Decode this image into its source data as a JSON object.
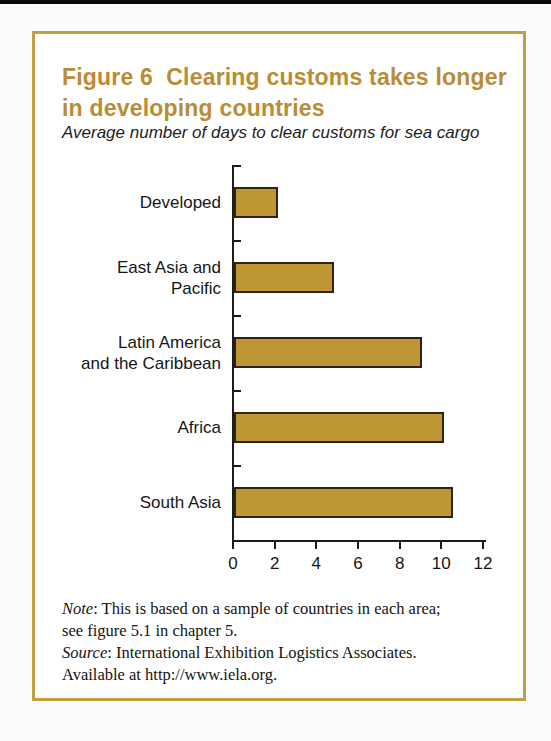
{
  "page": {
    "top_strip_color": "#0a0a0a",
    "background_color": "#FCFCFA"
  },
  "figure": {
    "title": "Figure 6  Clearing customs takes longer\nin developing countries",
    "subtitle": "Average number of days to clear customs for sea cargo",
    "title_color": "#BA8C35",
    "border_color": "#C5A043"
  },
  "chart_data": {
    "type": "bar",
    "orientation": "horizontal",
    "title": "Figure 6  Clearing customs takes longer in developing countries",
    "subtitle": "Average number of days to clear customs for sea cargo",
    "categories": [
      "Developed",
      "East Asia and\nPacific",
      "Latin America\nand the Caribbean",
      "Africa",
      "South Asia"
    ],
    "values": [
      2.1,
      4.8,
      9.0,
      10.1,
      10.5
    ],
    "xlabel": "",
    "ylabel": "",
    "x_ticks": [
      0,
      2,
      4,
      6,
      8,
      10,
      12
    ],
    "xlim": [
      0,
      12
    ],
    "grid": false,
    "legend": null,
    "bar_color": "#BF9634",
    "bar_border_color": "#2B2313",
    "axis_color": "#1c1c1c"
  },
  "notes": {
    "note_label": "Note",
    "note_line1_rest": ": This is based on a sample of countries in each area;",
    "note_line2": "see figure 5.1 in chapter 5.",
    "source_label": "Source",
    "source_line1_rest": ": International Exhibition Logistics Associates.",
    "source_line2": "Available at http://www.iela.org."
  }
}
